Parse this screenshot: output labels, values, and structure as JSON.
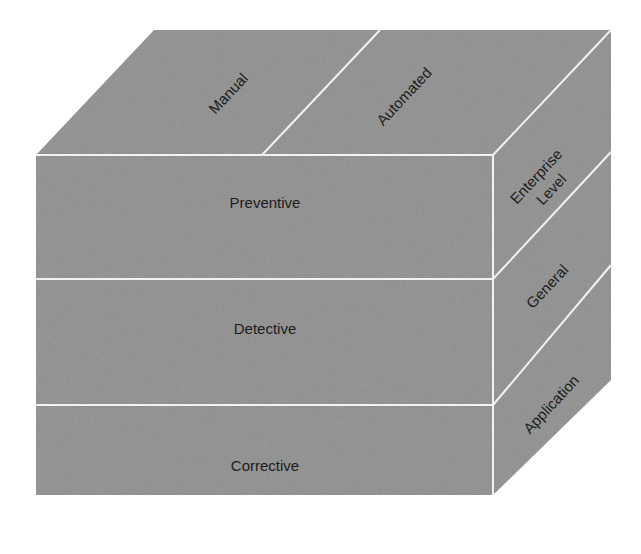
{
  "diagram": {
    "type": "3d-cube-taxonomy",
    "colors": {
      "face_fill": "#8f8f8f",
      "edge": "#f2f2f2",
      "text": "#1c1c1c",
      "background": "#ffffff"
    },
    "front_face": {
      "rows": [
        {
          "label": "Preventive"
        },
        {
          "label": "Detective"
        },
        {
          "label": "Corrective"
        }
      ]
    },
    "top_face": {
      "columns": [
        {
          "label": "Manual"
        },
        {
          "label": "Automated"
        }
      ]
    },
    "right_face": {
      "rows": [
        {
          "label_line1": "Enterprise",
          "label_line2": "Level"
        },
        {
          "label": "General"
        },
        {
          "label": "Application"
        }
      ]
    }
  }
}
